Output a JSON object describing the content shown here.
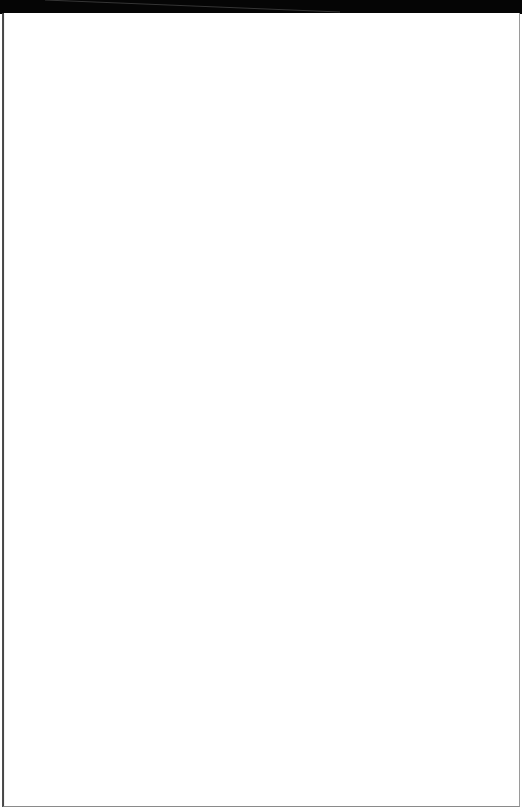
{
  "document": {
    "type": "scanned-page",
    "content": "",
    "colors": {
      "background": "#ffffff",
      "top_band": "#050505",
      "border": "#3a3a3a"
    }
  }
}
